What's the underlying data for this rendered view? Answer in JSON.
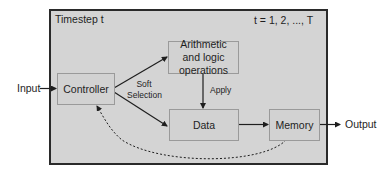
{
  "diagram": {
    "frame": {
      "title": "Timestep t",
      "range_label": "t = 1, 2, ..., T"
    },
    "nodes": {
      "controller": "Controller",
      "arithmetic": "Arithmetic and logic operations",
      "data": "Data",
      "memory": "Memory"
    },
    "external": {
      "input": "Input",
      "output": "Output"
    },
    "edge_labels": {
      "soft_selection_line1": "Soft",
      "soft_selection_line2": "Selection",
      "apply": "Apply"
    },
    "edges": [
      {
        "from": "Input",
        "to": "Controller",
        "style": "solid"
      },
      {
        "from": "Controller",
        "to": "Arithmetic and logic operations",
        "style": "solid",
        "label": "Soft Selection"
      },
      {
        "from": "Controller",
        "to": "Data",
        "style": "solid",
        "label": "Soft Selection"
      },
      {
        "from": "Arithmetic and logic operations",
        "to": "Data",
        "style": "solid",
        "label": "Apply"
      },
      {
        "from": "Data",
        "to": "Memory",
        "style": "solid"
      },
      {
        "from": "Memory",
        "to": "Output",
        "style": "solid"
      },
      {
        "from": "Memory",
        "to": "Controller",
        "style": "dotted"
      }
    ],
    "colors": {
      "frame_fill": "#d4d4d4",
      "frame_border": "#2a2a2a",
      "box_border": "#9a9a9a",
      "arrow": "#1e1e1e"
    }
  }
}
